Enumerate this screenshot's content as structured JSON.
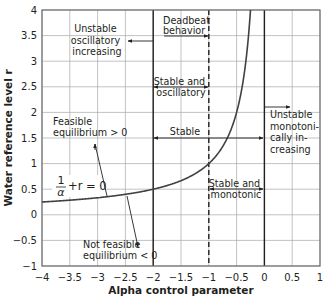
{
  "chart_data": {
    "type": "line",
    "title": "",
    "xlabel": "Alpha control parameter",
    "ylabel": "Water reference level r",
    "xlim": [
      -4,
      1
    ],
    "ylim": [
      -1,
      4
    ],
    "grid": true,
    "x_ticks": [
      "-4",
      "-3.5",
      "-3",
      "-2.5",
      "-2",
      "-1.5",
      "-1",
      "-0.5",
      "0",
      "0.5",
      "1"
    ],
    "y_ticks": [
      "-1",
      "-0.5",
      "0",
      "0.5",
      "1",
      "1.5",
      "2",
      "2.5",
      "3",
      "3.5",
      "4"
    ],
    "series": [
      {
        "name": "1/alpha + r = 0",
        "equation": "r = -1/alpha",
        "x": [
          -4,
          -3.5,
          -3,
          -2.5,
          -2,
          -1.5,
          -1,
          -0.75,
          -0.5,
          -0.4,
          -0.3,
          -0.25
        ],
        "values": [
          0.25,
          0.286,
          0.333,
          0.4,
          0.5,
          0.667,
          1.0,
          1.333,
          2.0,
          2.5,
          3.333,
          4.0
        ]
      }
    ],
    "vertical_lines": [
      {
        "x": -2,
        "style": "solid"
      },
      {
        "x": -1,
        "style": "dashed"
      },
      {
        "x": 0,
        "style": "solid"
      }
    ],
    "annotations": [
      {
        "text": "Unstable oscillatory increasing",
        "lines": [
          "Unstable",
          "oscillatory",
          "increasing"
        ],
        "arrow": "from x=-2 leftward at r=3.4"
      },
      {
        "text": "Deadbeat behavior",
        "lines": [
          "Deadbeat",
          "behavior"
        ],
        "arrow": "to x=-1 at r=3.5"
      },
      {
        "text": "Stable and oscillatory",
        "lines": [
          "Stable and",
          "oscillatory"
        ],
        "arrow": "double, x=-2 to x=-1 at r=2.5"
      },
      {
        "text": "Stable",
        "lines": [
          "Stable"
        ],
        "arrow": "double, x=-2 to x=0 at r=1.5"
      },
      {
        "text": "Unstable monotonically increasing",
        "lines": [
          "Unstable",
          "monotoni-",
          "cally in-",
          "creasing"
        ],
        "arrow": "from x=0 rightward at r=1.9"
      },
      {
        "text": "Stable and monotonic",
        "lines": [
          "Stable and",
          "monotonic"
        ],
        "arrow": "double, x=-1 to x=0 at r=0.5"
      },
      {
        "text": "Feasible equilibrium > 0",
        "lines": [
          "Feasible",
          "equilibrium > 0"
        ],
        "arrow": "from curve upward"
      },
      {
        "text": "Not feasible equilibrium < 0",
        "lines": [
          "Not feasible",
          "equilibrium < 0"
        ],
        "arrow": "from curve downward"
      },
      {
        "text": "1/α + r = 0",
        "position": "curve label near alpha=-3.7, r=0.55"
      }
    ]
  },
  "labels": {
    "xlabel": "Alpha control parameter",
    "ylabel": "Water reference level r",
    "curve_num": "1",
    "curve_den": "α",
    "curve_rest": "+r = 0",
    "ann_unstable_osc": [
      "Unstable",
      "oscillatory",
      "increasing"
    ],
    "ann_deadbeat": [
      "Deadbeat",
      "behavior"
    ],
    "ann_stable_osc": [
      "Stable and",
      "oscillatory"
    ],
    "ann_stable": "Stable",
    "ann_unstable_mono": [
      "Unstable",
      "monotoni-",
      "cally in-",
      "creasing"
    ],
    "ann_stable_mono": [
      "Stable and",
      "monotonic"
    ],
    "ann_feasible": [
      "Feasible",
      "equilibrium > 0"
    ],
    "ann_not_feasible": [
      "Not feasible",
      "equilibrium < 0"
    ]
  },
  "colors": {
    "line": "#231f20",
    "grid": "#a7a9ac",
    "frame": "#6d6e71",
    "curve": "#414042"
  }
}
